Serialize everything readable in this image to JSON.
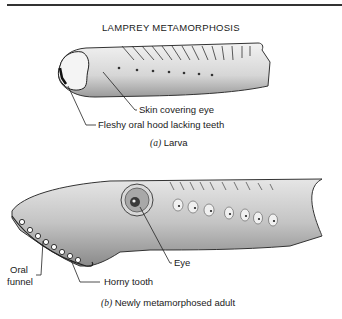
{
  "title": "LAMPREY METAMORPHOSIS",
  "panels": [
    {
      "id": "a",
      "caption_letter": "(a)",
      "caption_text": "Larva",
      "labels": [
        {
          "text": "Skin covering eye"
        },
        {
          "text": "Fleshy oral hood lacking teeth"
        }
      ]
    },
    {
      "id": "b",
      "caption_letter": "(b)",
      "caption_text": "Newly metamorphosed adult",
      "labels": [
        {
          "text": "Eye"
        },
        {
          "text": "Oral"
        },
        {
          "text": "funnel"
        },
        {
          "text": "Horny tooth"
        }
      ]
    }
  ]
}
